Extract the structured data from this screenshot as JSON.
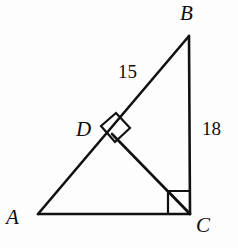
{
  "figure": {
    "background_color": "#fdfdfd",
    "stroke_color": "#111111"
  },
  "vertices": [
    {
      "id": "A",
      "label": "A",
      "x": 38,
      "y": 214
    },
    {
      "id": "B",
      "label": "B",
      "x": 189,
      "y": 36
    },
    {
      "id": "C",
      "label": "C",
      "x": 190,
      "y": 214
    },
    {
      "id": "D",
      "label": "D",
      "x": 112,
      "y": 134
    }
  ],
  "segments": [
    {
      "name": "AB",
      "from": "A",
      "to": "B",
      "x1": 38,
      "y1": 214,
      "x2": 189,
      "y2": 36
    },
    {
      "name": "BC",
      "from": "B",
      "to": "C",
      "x1": 189,
      "y1": 36,
      "x2": 190,
      "y2": 214
    },
    {
      "name": "AC",
      "from": "A",
      "to": "C",
      "x1": 38,
      "y1": 214,
      "x2": 190,
      "y2": 214
    },
    {
      "name": "DC",
      "from": "D",
      "to": "C",
      "x1": 112,
      "y1": 134,
      "x2": 190,
      "y2": 214
    }
  ],
  "length_labels": [
    {
      "segment": "AB",
      "text": "15",
      "x": 128,
      "y": 74
    },
    {
      "segment": "BC",
      "text": "18",
      "x": 213,
      "y": 131
    }
  ],
  "right_angles": [
    {
      "at": "C",
      "description": "right angle at vertex C between side AC and side BC",
      "marker_points": "168,214 168,191 190,191",
      "marker_diagonal": "168,191 190,214"
    },
    {
      "at": "D",
      "description": "right angle at point D between hypotenuse AB and altitude DC",
      "marker_points": "101,126 116,113 130,128 115,142"
    }
  ],
  "colors": {
    "ink": "#111111",
    "paper": "#fdfdfd"
  }
}
